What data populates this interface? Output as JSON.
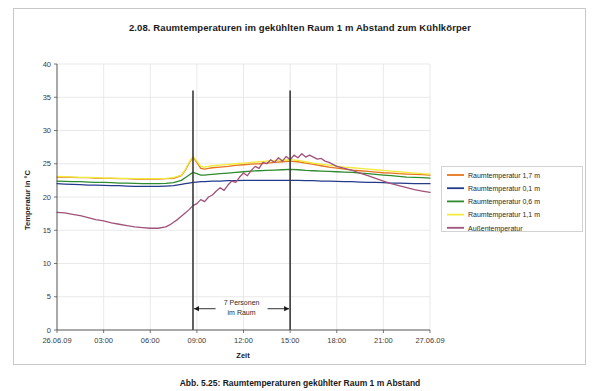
{
  "chart_data": {
    "type": "line",
    "title": "2.08. Raumtemperaturen im gekühlten Raum 1 m Abstand zum Kühlkörper",
    "xlabel": "Zeit",
    "ylabel": "Temperatur in °C",
    "ylim": [
      0,
      40
    ],
    "yticks": [
      0,
      5,
      10,
      15,
      20,
      25,
      30,
      35,
      40
    ],
    "xlim": [
      0,
      24
    ],
    "xticks": [
      0,
      3,
      6,
      9,
      12,
      15,
      18,
      21,
      24
    ],
    "xticklabels": [
      "26.06.09",
      "03:00",
      "06:00",
      "09:00",
      "12:00",
      "15:00",
      "18:00",
      "21:00",
      "27.06.09"
    ],
    "grid": true,
    "legend_position": "right",
    "annotations": [
      {
        "name": "occupancy-span",
        "text_line1": "7 Personen",
        "text_line2": "im Raum",
        "x_start": 8.75,
        "x_end": 15.0,
        "y": 3.2
      }
    ],
    "markers": [
      {
        "name": "occupancy-start-line",
        "x": 8.75,
        "y_top": 36.0,
        "y_bottom": 0
      },
      {
        "name": "occupancy-end-line",
        "x": 15.0,
        "y_top": 36.0,
        "y_bottom": 0
      }
    ],
    "series": [
      {
        "name": "Raumtemperatur 1,7 m",
        "color": "#e8741c",
        "x": [
          0,
          0.5,
          1,
          1.5,
          2,
          2.5,
          3,
          3.5,
          4,
          4.5,
          5,
          5.5,
          6,
          6.5,
          7,
          7.5,
          8,
          8.25,
          8.5,
          8.75,
          9,
          9.25,
          9.5,
          9.75,
          10,
          10.5,
          11,
          11.5,
          12,
          12.5,
          13,
          13.5,
          14,
          14.5,
          15,
          15.5,
          16,
          16.5,
          17,
          17.5,
          18,
          18.5,
          19,
          19.5,
          20,
          20.5,
          21,
          21.5,
          22,
          22.5,
          23,
          23.5,
          24
        ],
        "values": [
          23.0,
          23.0,
          22.95,
          22.9,
          22.9,
          22.85,
          22.8,
          22.8,
          22.75,
          22.75,
          22.7,
          22.7,
          22.7,
          22.7,
          22.75,
          22.8,
          23.2,
          24.0,
          25.1,
          26.0,
          25.2,
          24.3,
          24.2,
          24.3,
          24.4,
          24.5,
          24.6,
          24.75,
          24.85,
          24.95,
          25.0,
          25.1,
          25.2,
          25.3,
          25.4,
          25.3,
          25.1,
          24.9,
          24.7,
          24.5,
          24.35,
          24.2,
          24.05,
          23.95,
          23.85,
          23.75,
          23.65,
          23.6,
          23.5,
          23.45,
          23.4,
          23.35,
          23.3
        ]
      },
      {
        "name": "Raumtemperatur 0,1 m",
        "color": "#263a8c",
        "x": [
          0,
          0.5,
          1,
          1.5,
          2,
          2.5,
          3,
          3.5,
          4,
          4.5,
          5,
          5.5,
          6,
          6.5,
          7,
          7.5,
          8,
          8.25,
          8.5,
          8.75,
          9,
          9.25,
          9.5,
          9.75,
          10,
          10.5,
          11,
          11.5,
          12,
          12.5,
          13,
          13.5,
          14,
          14.5,
          15,
          15.5,
          16,
          16.5,
          17,
          17.5,
          18,
          18.5,
          19,
          19.5,
          20,
          20.5,
          21,
          21.5,
          22,
          22.5,
          23,
          23.5,
          24
        ],
        "values": [
          22.0,
          21.95,
          21.9,
          21.85,
          21.8,
          21.8,
          21.75,
          21.7,
          21.7,
          21.65,
          21.6,
          21.6,
          21.6,
          21.6,
          21.65,
          21.7,
          21.9,
          22.0,
          22.1,
          22.2,
          22.25,
          22.3,
          22.3,
          22.35,
          22.4,
          22.4,
          22.45,
          22.45,
          22.5,
          22.5,
          22.5,
          22.5,
          22.5,
          22.5,
          22.5,
          22.5,
          22.45,
          22.45,
          22.4,
          22.4,
          22.35,
          22.3,
          22.3,
          22.25,
          22.2,
          22.2,
          22.15,
          22.1,
          22.1,
          22.05,
          22.0,
          22.0,
          22.0
        ]
      },
      {
        "name": "Raumtemperatur 0,6 m",
        "color": "#2e8b2e",
        "x": [
          0,
          0.5,
          1,
          1.5,
          2,
          2.5,
          3,
          3.5,
          4,
          4.5,
          5,
          5.5,
          6,
          6.5,
          7,
          7.5,
          8,
          8.25,
          8.5,
          8.75,
          9,
          9.25,
          9.5,
          9.75,
          10,
          10.5,
          11,
          11.5,
          12,
          12.5,
          13,
          13.5,
          14,
          14.5,
          15,
          15.5,
          16,
          16.5,
          17,
          17.5,
          18,
          18.5,
          19,
          19.5,
          20,
          20.5,
          21,
          21.5,
          22,
          22.5,
          23,
          23.5,
          24
        ],
        "values": [
          22.4,
          22.35,
          22.3,
          22.3,
          22.25,
          22.2,
          22.2,
          22.15,
          22.1,
          22.1,
          22.05,
          22.0,
          22.0,
          22.0,
          22.05,
          22.15,
          22.5,
          22.9,
          23.3,
          23.7,
          23.5,
          23.3,
          23.3,
          23.35,
          23.4,
          23.5,
          23.6,
          23.7,
          23.8,
          23.9,
          23.95,
          24.0,
          24.05,
          24.1,
          24.15,
          24.1,
          24.0,
          23.95,
          23.9,
          23.85,
          23.8,
          23.75,
          23.7,
          23.6,
          23.5,
          23.4,
          23.3,
          23.2,
          23.1,
          23.0,
          22.95,
          22.9,
          22.85
        ]
      },
      {
        "name": "Raumtemperatur 1,1 m",
        "color": "#f2ea3a",
        "x": [
          0,
          0.5,
          1,
          1.5,
          2,
          2.5,
          3,
          3.5,
          4,
          4.5,
          5,
          5.5,
          6,
          6.5,
          7,
          7.5,
          8,
          8.25,
          8.5,
          8.75,
          9,
          9.25,
          9.5,
          9.75,
          10,
          10.5,
          11,
          11.5,
          12,
          12.5,
          13,
          13.5,
          14,
          14.5,
          15,
          15.5,
          16,
          16.5,
          17,
          17.5,
          18,
          18.5,
          19,
          19.5,
          20,
          20.5,
          21,
          21.5,
          22,
          22.5,
          23,
          23.5,
          24
        ],
        "values": [
          23.1,
          23.05,
          23.0,
          22.95,
          22.95,
          22.9,
          22.85,
          22.85,
          22.8,
          22.8,
          22.75,
          22.75,
          22.75,
          22.75,
          22.8,
          22.9,
          23.3,
          24.1,
          25.2,
          26.1,
          25.4,
          24.6,
          24.5,
          24.6,
          24.7,
          24.8,
          24.9,
          25.0,
          25.1,
          25.2,
          25.3,
          25.4,
          25.5,
          25.55,
          25.6,
          25.5,
          25.3,
          25.1,
          24.95,
          24.8,
          24.65,
          24.5,
          24.4,
          24.3,
          24.2,
          24.1,
          24.0,
          23.9,
          23.8,
          23.7,
          23.6,
          23.5,
          23.45
        ]
      },
      {
        "name": "Außentemperatur",
        "color": "#a0527a",
        "x": [
          0,
          0.5,
          1,
          1.5,
          2,
          2.5,
          3,
          3.5,
          4,
          4.5,
          5,
          5.5,
          6,
          6.5,
          7,
          7.25,
          7.5,
          7.75,
          8,
          8.25,
          8.5,
          8.75,
          9,
          9.25,
          9.5,
          9.75,
          10,
          10.25,
          10.5,
          10.75,
          11,
          11.25,
          11.5,
          11.75,
          12,
          12.25,
          12.5,
          12.75,
          13,
          13.25,
          13.5,
          13.75,
          14,
          14.25,
          14.5,
          14.75,
          15,
          15.25,
          15.5,
          15.75,
          16,
          16.25,
          16.5,
          16.75,
          17,
          17.25,
          17.5,
          17.75,
          18,
          18.5,
          19,
          19.5,
          20,
          20.5,
          21,
          21.5,
          22,
          22.5,
          23,
          23.5,
          24
        ],
        "values": [
          17.7,
          17.6,
          17.4,
          17.2,
          16.9,
          16.6,
          16.4,
          16.1,
          15.9,
          15.7,
          15.5,
          15.4,
          15.3,
          15.3,
          15.5,
          15.8,
          16.2,
          16.6,
          17.1,
          17.6,
          18.1,
          18.7,
          19.0,
          19.6,
          19.3,
          20.0,
          20.3,
          20.9,
          21.4,
          21.0,
          21.8,
          22.4,
          22.2,
          23.0,
          23.6,
          23.2,
          24.0,
          24.6,
          24.3,
          25.2,
          25.0,
          25.6,
          25.2,
          25.9,
          25.4,
          26.1,
          25.6,
          26.3,
          25.9,
          26.5,
          26.0,
          26.3,
          26.0,
          25.7,
          25.8,
          25.4,
          25.2,
          24.9,
          24.6,
          24.3,
          24.0,
          23.6,
          23.2,
          22.8,
          22.4,
          22.0,
          21.7,
          21.4,
          21.1,
          20.9,
          20.7
        ]
      }
    ]
  },
  "caption": {
    "text": "Abb. 5.25: Raumtemperaturen gekühlter Raum 1 m Abstand"
  }
}
